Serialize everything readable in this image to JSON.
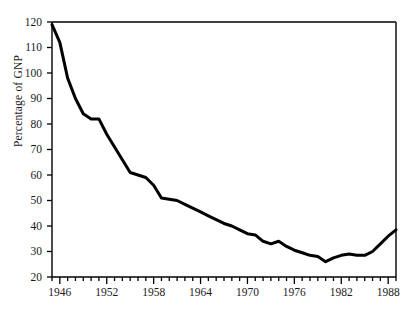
{
  "chart_data": {
    "type": "line",
    "title": "",
    "xlabel": "",
    "ylabel": "Percentage of GNP",
    "xlim": [
      1945,
      1989
    ],
    "ylim": [
      20,
      120
    ],
    "y_tick_labels": [
      "20",
      "30",
      "40",
      "50",
      "60",
      "70",
      "80",
      "90",
      "100",
      "110",
      "120"
    ],
    "y_ticks": [
      20,
      30,
      40,
      50,
      60,
      70,
      80,
      90,
      100,
      110,
      120
    ],
    "x_tick_labels": [
      "1946",
      "1952",
      "1958",
      "1964",
      "1970",
      "1976",
      "1982",
      "1988"
    ],
    "x_major_ticks": [
      1946,
      1952,
      1958,
      1964,
      1970,
      1976,
      1982,
      1988
    ],
    "x_minor_tick_step": 1,
    "grid": false,
    "legend": false,
    "line_color": "#000000",
    "line_width": 3,
    "x": [
      1945,
      1946,
      1947,
      1948,
      1949,
      1950,
      1951,
      1952,
      1953,
      1954,
      1955,
      1956,
      1957,
      1958,
      1959,
      1960,
      1961,
      1962,
      1963,
      1964,
      1965,
      1966,
      1967,
      1968,
      1969,
      1970,
      1971,
      1972,
      1973,
      1974,
      1975,
      1976,
      1977,
      1978,
      1979,
      1980,
      1981,
      1982,
      1983,
      1984,
      1985,
      1986,
      1987,
      1988,
      1989
    ],
    "values": [
      119,
      112,
      98,
      90,
      84,
      82,
      82,
      76,
      71,
      66,
      61,
      60,
      59,
      56,
      51,
      50.5,
      50,
      48.5,
      47,
      45.5,
      44,
      42.5,
      41,
      40,
      38.5,
      37,
      36.5,
      34,
      33,
      34,
      32,
      30.5,
      29.5,
      28.5,
      28,
      26,
      27.5,
      28.5,
      29,
      28.5,
      28.5,
      30,
      33,
      36,
      38.5
    ],
    "annotations": []
  },
  "axis": {
    "spines": {
      "left": true,
      "top": true,
      "right": true,
      "bottom": true
    }
  }
}
